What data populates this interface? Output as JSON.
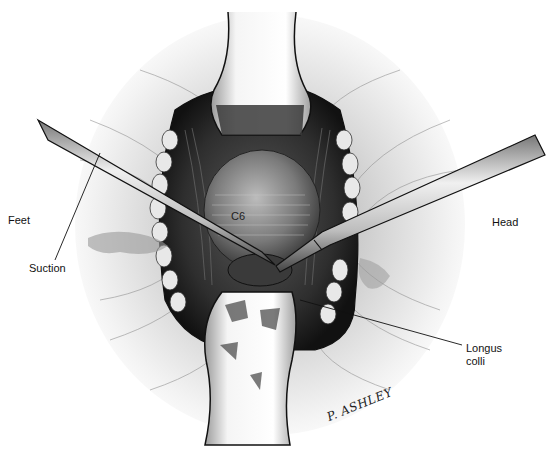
{
  "figure": {
    "labels": {
      "feet": "Feet",
      "head": "Head",
      "suction": "Suction",
      "c6": "C6",
      "longus_colli": "Longus\ncolli"
    },
    "signature": "P. ASHLEY",
    "colors": {
      "background": "#ffffff",
      "skin_shading": "#d8d8d8",
      "cavity_dark": "#2a2a2a",
      "vertebra": "#8a8a8a",
      "instrument": "#cfcfcf",
      "outline": "#111111"
    }
  }
}
